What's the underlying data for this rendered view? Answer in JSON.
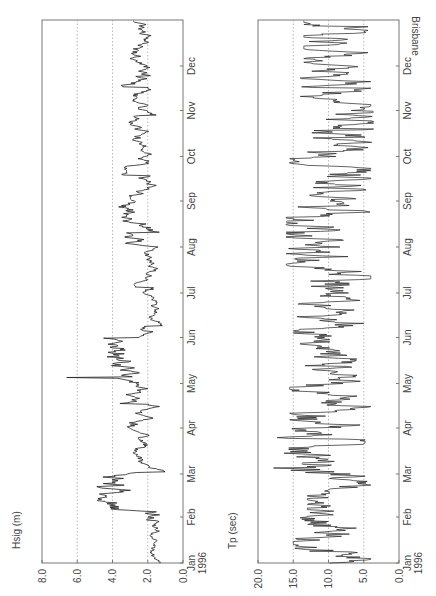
{
  "site": "Brisbane",
  "chart_data": [
    {
      "type": "line",
      "title": "",
      "ylabel": "Hsig (m)",
      "xlabel": "",
      "ylim": [
        0,
        8
      ],
      "yticks": [
        "0.0",
        "2.0",
        "4.0",
        "6.0",
        "8.0"
      ],
      "gridlines_y": [
        2,
        4,
        6
      ],
      "grid": "dotted horizontal",
      "categories": [
        "Jan\n1996",
        "Feb",
        "Mar",
        "Apr",
        "May",
        "Jun",
        "Jul",
        "Aug",
        "Sep",
        "Oct",
        "Nov",
        "Dec"
      ],
      "series": [
        {
          "name": "Hsig",
          "monthly_typical_range_m": [
            [
              0.8,
              2.2
            ],
            [
              0.6,
              6.2
            ],
            [
              1.0,
              3.2
            ],
            [
              0.8,
              3.6
            ],
            [
              1.2,
              6.5
            ],
            [
              1.0,
              2.5
            ],
            [
              1.2,
              2.8
            ],
            [
              1.2,
              4.7
            ],
            [
              1.0,
              3.5
            ],
            [
              1.2,
              3.6
            ],
            [
              1.0,
              3.5
            ],
            [
              1.2,
              3.5
            ]
          ],
          "peak_m": 6.6,
          "peak_month": "May"
        }
      ],
      "orientation": "rotated 90deg counter-clockwise"
    },
    {
      "type": "line",
      "title": "",
      "ylabel": "Tp (sec)",
      "xlabel": "",
      "ylim": [
        0,
        20
      ],
      "yticks": [
        "0.0",
        "5.0",
        "10.0",
        "15.0",
        "20.0"
      ],
      "gridlines_y": [
        5,
        10,
        15
      ],
      "grid": "dotted horizontal",
      "categories": [
        "Jan\n1996",
        "Feb",
        "Mar",
        "Apr",
        "May",
        "Jun",
        "Jul",
        "Aug",
        "Sep",
        "Oct",
        "Nov",
        "Dec"
      ],
      "series": [
        {
          "name": "Tp",
          "monthly_typical_range_s": [
            [
              5.0,
              15.0
            ],
            [
              5.0,
              13.0
            ],
            [
              6.0,
              17.5
            ],
            [
              5.0,
              15.5
            ],
            [
              6.0,
              14.0
            ],
            [
              5.5,
              15.0
            ],
            [
              5.0,
              16.0
            ],
            [
              4.5,
              16.0
            ],
            [
              5.0,
              15.5
            ],
            [
              4.5,
              13.0
            ],
            [
              5.0,
              14.0
            ],
            [
              5.5,
              13.5
            ]
          ],
          "peak_s": 17.8,
          "peak_month": "Mar"
        }
      ],
      "orientation": "rotated 90deg counter-clockwise"
    }
  ]
}
